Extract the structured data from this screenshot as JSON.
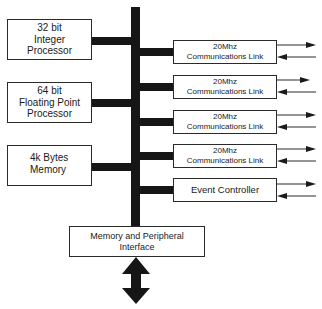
{
  "diagram": {
    "type": "block-diagram",
    "bus": {
      "color": "#161616"
    },
    "left_blocks": [
      {
        "lines": [
          "32 bit",
          "Integer",
          "Processor"
        ]
      },
      {
        "lines": [
          "64 bit",
          "Floating Point",
          "Processor"
        ]
      },
      {
        "lines": [
          "4k Bytes",
          "Memory"
        ]
      }
    ],
    "right_blocks": [
      {
        "lines": [
          "20Mhz",
          "Communications Link"
        ]
      },
      {
        "lines": [
          "20Mhz",
          "Communications Link"
        ]
      },
      {
        "lines": [
          "20Mhz",
          "Communications Link"
        ]
      },
      {
        "lines": [
          "20Mhz",
          "Communications Link"
        ]
      },
      {
        "lines": [
          "Event Controller"
        ]
      }
    ],
    "bottom_block": {
      "lines": [
        "Memory and Peripheral",
        "Interface"
      ]
    },
    "bottom_arrow": "bidirectional-arrow"
  }
}
